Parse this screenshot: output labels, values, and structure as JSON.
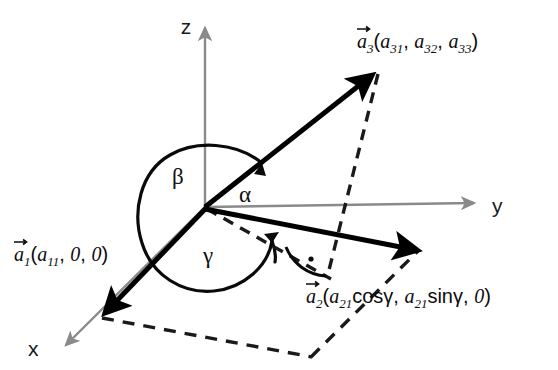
{
  "figure": {
    "background_color": "#ffffff",
    "width": 558,
    "height": 370
  },
  "axes": {
    "color": "#8a8a8a",
    "items": [
      {
        "name": "z-axis",
        "label": "z",
        "direction": "up",
        "label_x": 186,
        "label_y": 33,
        "from_x": 205,
        "from_y": 207,
        "to_x": 205,
        "to_y": 25
      },
      {
        "name": "y-axis",
        "label": "y",
        "direction": "right",
        "label_x": 495,
        "label_y": 212,
        "from_x": 205,
        "from_y": 207,
        "to_x": 478,
        "to_y": 203
      },
      {
        "name": "x-axis",
        "label": "x",
        "direction": "down-left",
        "label_x": 30,
        "label_y": 355,
        "from_x": 205,
        "from_y": 207,
        "to_x": 62,
        "to_y": 348
      }
    ]
  },
  "vectors": [
    {
      "name": "vector-a1",
      "label_parts": {
        "sym": "a",
        "sym_sub": "1",
        "open": "(",
        "c1": "a",
        "c1_sub": "11",
        "c2": "0",
        "c3": "0",
        "close": ")"
      },
      "label_text": "a₁(a₁₁, 0, 0)",
      "label_x": 14,
      "label_y": 258,
      "tip_x": 100,
      "tip_y": 315,
      "color": "#000000"
    },
    {
      "name": "vector-a2",
      "label_parts": {
        "sym": "a",
        "sym_sub": "2",
        "open": "(",
        "c1": "a",
        "c1_sub": "21",
        "c1_fn": "cos",
        "c1_angle": "γ",
        "c2": "a",
        "c2_sub": "21",
        "c2_fn": "sin",
        "c2_angle": "γ",
        "c3": "0",
        "close": ")"
      },
      "label_text": "a₂(a₂₁cosγ, a₂₁sinγ, 0)",
      "label_x": 306,
      "label_y": 300,
      "tip_x": 424,
      "tip_y": 248,
      "color": "#000000"
    },
    {
      "name": "vector-a3",
      "label_parts": {
        "sym": "a",
        "sym_sub": "3",
        "open": "(",
        "c1": "a",
        "c1_sub": "31",
        "c2": "a",
        "c2_sub": "32",
        "c3": "a",
        "c3_sub": "33",
        "close": ")"
      },
      "label_text": "a₃(a₃₁, a₃₂, a₃₃)",
      "label_x": 358,
      "label_y": 45,
      "tip_x": 378,
      "tip_y": 68,
      "color": "#000000"
    }
  ],
  "angles": [
    {
      "name": "angle-alpha",
      "label": "α",
      "label_x": 240,
      "label_y": 200,
      "description": "angle between y-axis and vector a3"
    },
    {
      "name": "angle-beta",
      "label": "β",
      "label_x": 175,
      "label_y": 182,
      "description": "angle between vector a1 and vector a3"
    },
    {
      "name": "angle-gamma",
      "label": "γ",
      "label_x": 205,
      "label_y": 260,
      "description": "angle between vector a1 and projection of a2"
    }
  ],
  "markers": [
    {
      "name": "right-angle-marker",
      "label": "·",
      "x": 316,
      "y": 262,
      "description": "right angle between projection and dashed drop line"
    }
  ],
  "projections": {
    "style": "dashed",
    "color": "#1a1a1a",
    "lines": [
      {
        "name": "a3-drop-line",
        "from_x": 378,
        "from_y": 72,
        "to_x": 327,
        "to_y": 276
      },
      {
        "name": "a2-projection-line",
        "from_x": 205,
        "from_y": 207,
        "to_x": 330,
        "to_y": 277
      },
      {
        "name": "base-plane-edge-1",
        "from_x": 102,
        "from_y": 318,
        "to_x": 312,
        "to_y": 356
      },
      {
        "name": "base-plane-edge-2",
        "from_x": 312,
        "from_y": 356,
        "to_x": 418,
        "to_y": 252
      }
    ]
  }
}
